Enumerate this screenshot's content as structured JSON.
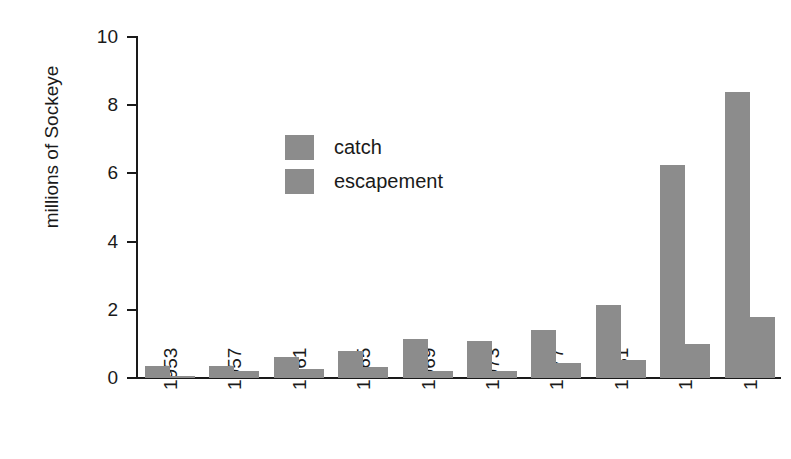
{
  "figure": {
    "faint_top_text": "",
    "background_color": "#ffffff",
    "bar_color": "#8c8c8c",
    "axis_color": "#1a1a1a"
  },
  "legend": {
    "position": "inside-upper-left",
    "entries": [
      {
        "label": "catch",
        "color": "#8c8c8c"
      },
      {
        "label": "escapement",
        "color": "#8c8c8c"
      }
    ]
  },
  "axes": {
    "ylabel": "millions of Sockeye",
    "xlabel": "",
    "yticks": [
      "0",
      "2",
      "4",
      "6",
      "8",
      "10"
    ],
    "xticks": [
      "1953",
      "1957",
      "1961",
      "1965",
      "1969",
      "1973",
      "1977",
      "1981",
      "1985",
      "1989"
    ]
  },
  "chart_data": {
    "type": "bar",
    "title": "",
    "xlabel": "",
    "ylabel": "millions of Sockeye",
    "categories": [
      "1953",
      "1957",
      "1961",
      "1965",
      "1969",
      "1973",
      "1977",
      "1981",
      "1985",
      "1989"
    ],
    "series": [
      {
        "name": "catch",
        "color": "#8c8c8c",
        "values": [
          0.35,
          0.35,
          0.62,
          0.78,
          1.15,
          1.08,
          1.42,
          2.15,
          6.25,
          8.4
        ]
      },
      {
        "name": "escapement",
        "color": "#8c8c8c",
        "values": [
          0.05,
          0.22,
          0.27,
          0.33,
          0.2,
          0.2,
          0.43,
          0.52,
          1.0,
          1.78
        ]
      }
    ],
    "ylim": [
      0,
      10
    ],
    "ytick_values": [
      0,
      2,
      4,
      6,
      8,
      10
    ],
    "grid": false,
    "legend_position": "upper left (inside plot)",
    "grouping": "grouped-pairs",
    "xtick_rotation": -90
  }
}
